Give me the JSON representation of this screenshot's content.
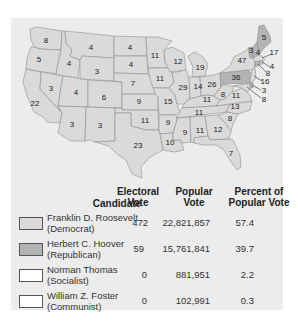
{
  "colors": {
    "democrat": "#dadada",
    "republican": "#b4b4b4",
    "socialist": "#ffffff",
    "communist": "#ffffff",
    "panel": "#ececec",
    "border": "#8e8e8e"
  },
  "map": {
    "labels": [
      {
        "state": "WA",
        "value": "8",
        "x": 46,
        "y": 41
      },
      {
        "state": "OR",
        "value": "5",
        "x": 39,
        "y": 60
      },
      {
        "state": "CA",
        "value": "22",
        "x": 35,
        "y": 104
      },
      {
        "state": "ID",
        "value": "4",
        "x": 69,
        "y": 64
      },
      {
        "state": "NV",
        "value": "3",
        "x": 51,
        "y": 89
      },
      {
        "state": "MT",
        "value": "4",
        "x": 91,
        "y": 48
      },
      {
        "state": "WY",
        "value": "3",
        "x": 97,
        "y": 72
      },
      {
        "state": "UT",
        "value": "4",
        "x": 76,
        "y": 93
      },
      {
        "state": "CO",
        "value": "6",
        "x": 104,
        "y": 98
      },
      {
        "state": "AZ",
        "value": "3",
        "x": 72,
        "y": 125
      },
      {
        "state": "NM",
        "value": "3",
        "x": 100,
        "y": 126
      },
      {
        "state": "ND",
        "value": "4",
        "x": 130,
        "y": 48
      },
      {
        "state": "SD",
        "value": "4",
        "x": 131,
        "y": 65
      },
      {
        "state": "NE",
        "value": "7",
        "x": 133,
        "y": 84
      },
      {
        "state": "KS",
        "value": "9",
        "x": 139,
        "y": 102
      },
      {
        "state": "OK",
        "value": "11",
        "x": 145,
        "y": 121
      },
      {
        "state": "TX",
        "value": "23",
        "x": 138,
        "y": 146
      },
      {
        "state": "MN",
        "value": "11",
        "x": 155,
        "y": 56
      },
      {
        "state": "IA",
        "value": "11",
        "x": 160,
        "y": 79
      },
      {
        "state": "MO",
        "value": "15",
        "x": 168,
        "y": 102
      },
      {
        "state": "AR",
        "value": "9",
        "x": 168,
        "y": 123
      },
      {
        "state": "LA",
        "value": "10",
        "x": 170,
        "y": 143
      },
      {
        "state": "WI",
        "value": "12",
        "x": 178,
        "y": 62
      },
      {
        "state": "IL",
        "value": "29",
        "x": 183,
        "y": 88
      },
      {
        "state": "MI",
        "value": "19",
        "x": 200,
        "y": 68
      },
      {
        "state": "IN",
        "value": "14",
        "x": 198,
        "y": 87
      },
      {
        "state": "OH",
        "value": "26",
        "x": 212,
        "y": 85
      },
      {
        "state": "KY",
        "value": "11",
        "x": 207,
        "y": 100
      },
      {
        "state": "TN",
        "value": "11",
        "x": 199,
        "y": 113
      },
      {
        "state": "MS",
        "value": "9",
        "x": 185,
        "y": 133
      },
      {
        "state": "AL",
        "value": "11",
        "x": 200,
        "y": 131
      },
      {
        "state": "GA",
        "value": "12",
        "x": 218,
        "y": 130
      },
      {
        "state": "FL",
        "value": "7",
        "x": 231,
        "y": 154
      },
      {
        "state": "SC",
        "value": "8",
        "x": 230,
        "y": 119
      },
      {
        "state": "NC",
        "value": "13",
        "x": 235,
        "y": 107
      },
      {
        "state": "VA",
        "value": "11",
        "x": 236,
        "y": 96
      },
      {
        "state": "WV",
        "value": "8",
        "x": 223,
        "y": 95
      },
      {
        "state": "PA",
        "value": "36",
        "x": 236,
        "y": 78
      },
      {
        "state": "NY",
        "value": "47",
        "x": 242,
        "y": 61
      },
      {
        "state": "VT",
        "value": "3",
        "x": 251,
        "y": 51
      },
      {
        "state": "NH",
        "value": "4",
        "x": 258,
        "y": 53
      },
      {
        "state": "ME",
        "value": "5",
        "x": 264,
        "y": 38
      },
      {
        "state": "MA",
        "value": "17",
        "x": 274,
        "y": 53
      },
      {
        "state": "RI",
        "value": "4",
        "x": 272,
        "y": 67
      },
      {
        "state": "CT",
        "value": "8",
        "x": 268,
        "y": 74
      },
      {
        "state": "NJ",
        "value": "16",
        "x": 265,
        "y": 82
      },
      {
        "state": "DE",
        "value": "3",
        "x": 264,
        "y": 91
      },
      {
        "state": "MD",
        "value": "8",
        "x": 264,
        "y": 100
      }
    ]
  },
  "legend": {
    "headers": {
      "candidate": "Candidate",
      "electoral_1": "Electoral",
      "electoral_2": "Vote",
      "popular_1": "Popular",
      "popular_2": "Vote",
      "percent_1": "Percent of",
      "percent_2": "Popular Vote"
    },
    "rows": [
      {
        "name": "Franklin D. Roosevelt",
        "party": "(Democrat)",
        "electoral": "472",
        "popular": "22,821,857",
        "percent": "57.4"
      },
      {
        "name": "Herbert C. Hoover",
        "party": "(Republican)",
        "electoral": "59",
        "popular": "15,761,841",
        "percent": "39.7"
      },
      {
        "name": "Norman Thomas",
        "party": "(Socialist)",
        "electoral": "0",
        "popular": "881,951",
        "percent": "2.2"
      },
      {
        "name": "William Z. Foster",
        "party": "(Communist)",
        "electoral": "0",
        "popular": "102,991",
        "percent": "0.3"
      }
    ]
  }
}
